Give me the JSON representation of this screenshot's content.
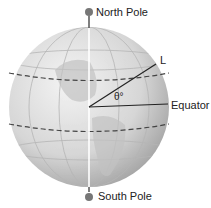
{
  "diagram": {
    "labels": {
      "north_pole": "North Pole",
      "south_pole": "South Pole",
      "latitude_point": "L",
      "angle": "θ°",
      "equator": "Equator"
    },
    "colors": {
      "globe_light": "#f2f2f2",
      "globe_dark": "#9a9a9a",
      "line": "#333333",
      "axis": "#ffffff"
    }
  }
}
